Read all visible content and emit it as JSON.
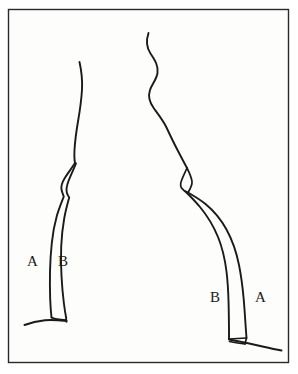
{
  "figure": {
    "background_color": "#fdfdfb",
    "frame_color": "#2a2a2a",
    "ink_color": "#1a1a1a",
    "frame": {
      "x": 8,
      "y": 9,
      "width": 281,
      "height": 354
    },
    "labels": {
      "left_a": "A",
      "left_b": "B",
      "right_b": "B",
      "right_a": "A"
    },
    "strokes": {
      "center_wave_name": "center-wavy-line",
      "left_outer_name": "left-curve-a",
      "left_inner_name": "left-curve-b",
      "right_outer_name": "right-curve-a",
      "right_inner_name": "right-curve-b",
      "left_ground_name": "left-ground-line",
      "right_ground_name": "right-ground-line"
    }
  }
}
